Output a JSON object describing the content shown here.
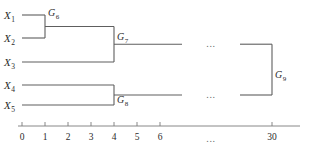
{
  "diagram": {
    "type": "dendrogram",
    "title": "",
    "orientation": "horizontal",
    "line_color": "#5e5e5e",
    "axis_color": "#7a7a7a",
    "text_color": "#2b2b2b",
    "background": "#ffffff"
  },
  "leaves": [
    {
      "id": "X1",
      "base": "X",
      "sub": "1",
      "y": 15,
      "start_x": 22
    },
    {
      "id": "X2",
      "base": "X",
      "sub": "2",
      "y": 38,
      "start_x": 22
    },
    {
      "id": "X3",
      "base": "X",
      "sub": "3",
      "y": 62,
      "start_x": 22
    },
    {
      "id": "X4",
      "base": "X",
      "sub": "4",
      "y": 85,
      "start_x": 22
    },
    {
      "id": "X5",
      "base": "X",
      "sub": "5",
      "y": 105,
      "start_x": 22
    }
  ],
  "nodes": [
    {
      "id": "G6",
      "base": "G",
      "sub": "6",
      "merge_value": 1,
      "x": 45,
      "top_y": 15,
      "bottom_y": 38,
      "mid_y": 26.5,
      "label_x": 48,
      "label_y": 16
    },
    {
      "id": "G7",
      "base": "G",
      "sub": "7",
      "merge_value": 4,
      "x": 114,
      "top_y": 26.5,
      "bottom_y": 62,
      "mid_y": 44.2,
      "label_x": 117,
      "label_y": 40
    },
    {
      "id": "G8",
      "base": "G",
      "sub": "8",
      "merge_value": 4,
      "x": 114,
      "top_y": 85,
      "bottom_y": 105,
      "mid_y": 95,
      "label_x": 117,
      "label_y": 103
    },
    {
      "id": "G9",
      "base": "G",
      "sub": "9",
      "merge_value": 30,
      "x": 272,
      "top_y": 44.2,
      "bottom_y": 95,
      "mid_y": 69.6,
      "label_x": 275,
      "label_y": 78
    }
  ],
  "branch_segments": [
    {
      "name": "x1-to-g6",
      "x1": 22,
      "y": 15,
      "x2": 45
    },
    {
      "name": "x2-to-g6",
      "x1": 22,
      "y": 38,
      "x2": 45
    },
    {
      "name": "g6-to-g7",
      "x1": 45,
      "y": 26.5,
      "x2": 114
    },
    {
      "name": "x3-to-g7",
      "x1": 22,
      "y": 62,
      "x2": 114
    },
    {
      "name": "x4-to-g8",
      "x1": 22,
      "y": 85,
      "x2": 114
    },
    {
      "name": "x5-to-g8",
      "x1": 22,
      "y": 105,
      "x2": 114
    },
    {
      "name": "g7-gap-left",
      "x1": 114,
      "y": 44.2,
      "x2": 182
    },
    {
      "name": "g7-gap-right",
      "x1": 240,
      "y": 44.2,
      "x2": 272
    },
    {
      "name": "g8-gap-left",
      "x1": 114,
      "y": 95,
      "x2": 182
    },
    {
      "name": "g8-gap-right",
      "x1": 240,
      "y": 95,
      "x2": 272
    }
  ],
  "ellipses": [
    {
      "name": "upper-branch-ellipsis",
      "text": "...",
      "x": 211,
      "y": 47
    },
    {
      "name": "lower-branch-ellipsis",
      "text": "...",
      "x": 211,
      "y": 98
    },
    {
      "name": "axis-ellipsis",
      "text": "...",
      "x": 211,
      "y": 142
    }
  ],
  "axis": {
    "name": "distance-axis",
    "y": 126,
    "start_x": 18,
    "end_x": 300,
    "tick_height": 4,
    "label_y": 140,
    "ticks": [
      {
        "label": "0",
        "value": 0,
        "x": 22,
        "show_mark": true
      },
      {
        "label": "1",
        "value": 1,
        "x": 45,
        "show_mark": true
      },
      {
        "label": "2",
        "value": 2,
        "x": 68,
        "show_mark": true
      },
      {
        "label": "3",
        "value": 3,
        "x": 91,
        "show_mark": true
      },
      {
        "label": "4",
        "value": 4,
        "x": 114,
        "show_mark": true
      },
      {
        "label": "5",
        "value": 5,
        "x": 137,
        "show_mark": true
      },
      {
        "label": "6",
        "value": 6,
        "x": 160,
        "show_mark": true
      },
      {
        "label": "30",
        "value": 30,
        "x": 272,
        "show_mark": true
      }
    ]
  }
}
